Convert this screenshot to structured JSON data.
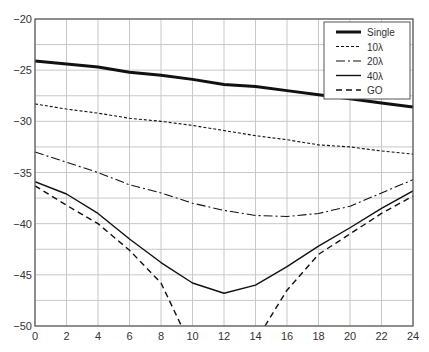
{
  "chart_data": {
    "type": "line",
    "title": "",
    "xlabel": "",
    "ylabel": "",
    "xlim": [
      0,
      24
    ],
    "ylim": [
      -50,
      -20
    ],
    "x_ticks": [
      0,
      2,
      4,
      6,
      8,
      10,
      12,
      14,
      16,
      18,
      20,
      22,
      24
    ],
    "y_ticks": [
      -20,
      -25,
      -30,
      -35,
      -40,
      -45,
      -50
    ],
    "y_tick_labels": [
      "−20",
      "−25",
      "−30",
      "−35",
      "−40",
      "−45",
      "−50"
    ],
    "grid": true,
    "minor_y_grid_step": 2.5,
    "legend_position": "upper right",
    "series": [
      {
        "name": "Single",
        "style": "solid-thick",
        "x": [
          0,
          2,
          4,
          6,
          8,
          10,
          12,
          14,
          16,
          18,
          20,
          22,
          24
        ],
        "values": [
          -24.1,
          -24.4,
          -24.7,
          -25.2,
          -25.5,
          -25.9,
          -26.4,
          -26.6,
          -27.0,
          -27.4,
          -27.8,
          -28.2,
          -28.6
        ]
      },
      {
        "name": "10λ",
        "style": "short-dash",
        "x": [
          0,
          2,
          4,
          6,
          8,
          10,
          12,
          14,
          16,
          18,
          20,
          22,
          24
        ],
        "values": [
          -28.3,
          -28.8,
          -29.2,
          -29.7,
          -30.0,
          -30.4,
          -30.9,
          -31.4,
          -31.8,
          -32.3,
          -32.5,
          -32.9,
          -33.2
        ]
      },
      {
        "name": "20λ",
        "style": "dash-dot",
        "x": [
          0,
          2,
          4,
          6,
          8,
          10,
          12,
          14,
          16,
          18,
          20,
          22,
          24
        ],
        "values": [
          -33.0,
          -34.0,
          -35.0,
          -36.2,
          -37.0,
          -38.0,
          -38.7,
          -39.2,
          -39.3,
          -39.0,
          -38.3,
          -37.0,
          -35.7
        ]
      },
      {
        "name": "40λ",
        "style": "solid",
        "x": [
          0,
          2,
          4,
          6,
          8,
          10,
          12,
          14,
          16,
          18,
          20,
          22,
          24
        ],
        "values": [
          -35.9,
          -37.1,
          -39.0,
          -41.5,
          -43.8,
          -45.8,
          -46.8,
          -46.0,
          -44.2,
          -42.2,
          -40.4,
          -38.5,
          -36.8
        ]
      },
      {
        "name": "GO",
        "style": "long-dash",
        "x": [
          0,
          2,
          4,
          6,
          8,
          9.3,
          14.6,
          16,
          18,
          20,
          22,
          24
        ],
        "values": [
          -36.3,
          -38.2,
          -40.0,
          -42.6,
          -45.8,
          -50.0,
          -50.0,
          -46.5,
          -43.0,
          -41.0,
          -39.0,
          -37.3
        ],
        "note": "drops below -50 between x=9.3 and x=14.6"
      }
    ]
  }
}
